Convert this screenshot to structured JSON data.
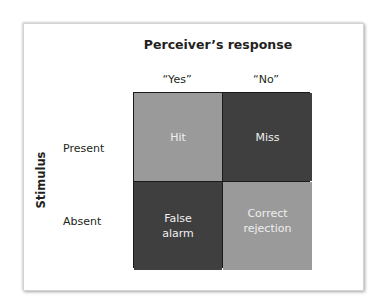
{
  "diagram": {
    "title": "Perceiver’s response",
    "row_axis_label": "Stimulus",
    "columns": [
      "“Yes”",
      "“No”"
    ],
    "rows": [
      "Present",
      "Absent"
    ],
    "cells": [
      {
        "row": "Present",
        "column": "“Yes”",
        "label": "Hit",
        "shade": "light"
      },
      {
        "row": "Present",
        "column": "“No”",
        "label": "Miss",
        "shade": "dark"
      },
      {
        "row": "Absent",
        "column": "“Yes”",
        "label": "False alarm",
        "line1": "False",
        "line2": "alarm",
        "shade": "dark"
      },
      {
        "row": "Absent",
        "column": "“No”",
        "label": "Correct rejection",
        "line1": "Correct",
        "line2": "rejection",
        "shade": "light"
      }
    ],
    "colors": {
      "light_cell": "#9a9a9a",
      "dark_cell": "#3f3f3f",
      "cell_text": "#efefef",
      "label_text": "#231f20"
    }
  }
}
